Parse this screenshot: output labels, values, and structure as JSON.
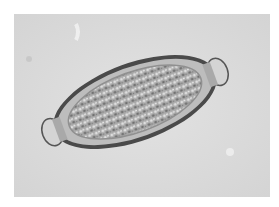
{
  "image": {
    "subject": "micrograph-egg",
    "colors": {
      "border": "#ffffff",
      "background": "#dcdcdc",
      "shell": "#3a3a3a",
      "interior": "#9a9a9a",
      "plug": "#c8c8c8"
    }
  }
}
